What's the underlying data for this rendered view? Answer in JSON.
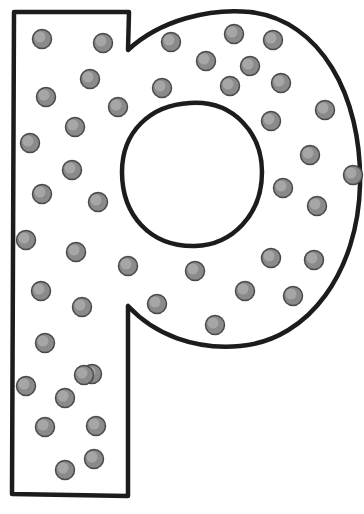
{
  "artwork": {
    "subject": "letter-p",
    "letter": "p",
    "style": "coloring-page outline with polka dots",
    "colors": {
      "background": "#ffffff",
      "outline": "#1c1c1c",
      "dot_fill": "#8a8a8a",
      "dot_edge": "#4a4a4a"
    },
    "dot_count": 52
  }
}
